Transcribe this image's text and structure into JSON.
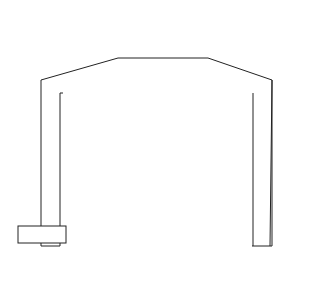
{
  "figure": {
    "panel_label": "(b)",
    "colors": {
      "ink": "#222222",
      "paper": "#ffffff",
      "oring": "#2a2a2a",
      "membrane": "#9a9a9a"
    }
  },
  "labels": {
    "orifice": [
      "Oriface for",
      "enzyme gel"
    ],
    "epoxy": [
      "Epoxy",
      "seal"
    ],
    "electrolyte": "Electrolyte solution",
    "nylon": [
      "Nylon net",
      "impregnated with",
      "silicone rubber"
    ],
    "membrane": "Plastic membrane",
    "oring": "Rubber O-ring",
    "cap": "Plastic cap",
    "housing": "Glass housing",
    "capillary": "Glass capillary tubes",
    "anode": [
      "Ag",
      "anode"
    ],
    "cathodes": [
      "Pt",
      "cathodes"
    ]
  }
}
